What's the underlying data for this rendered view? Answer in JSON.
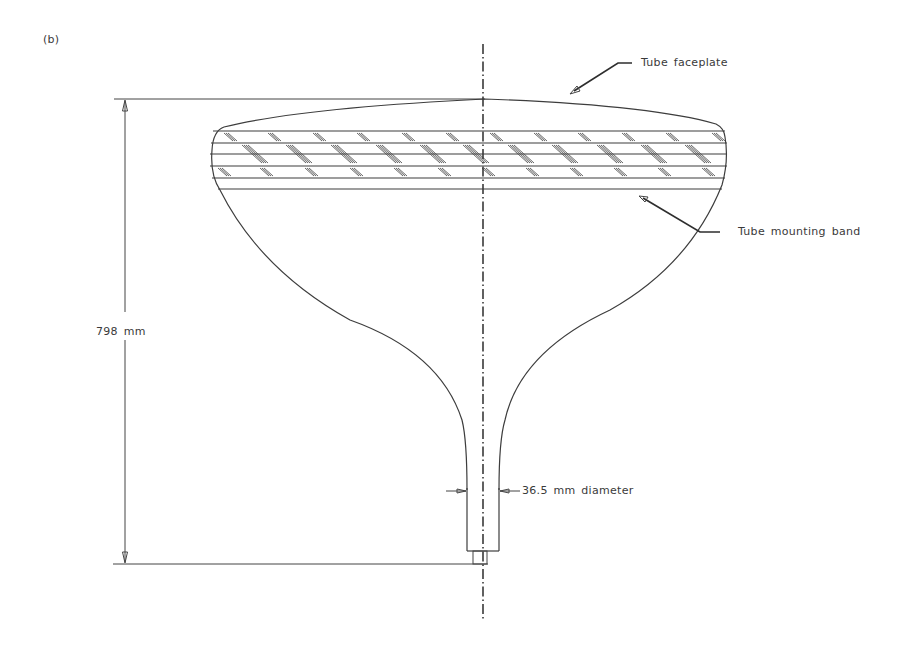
{
  "figure": {
    "panel_label": "(b)",
    "labels": {
      "faceplate": "Tube faceplate",
      "mounting_band": "Tube mounting band",
      "height_dimension": "798 mm",
      "neck_diameter": "36.5 mm diameter"
    },
    "dimensions": {
      "overall_height_mm": 798,
      "neck_diameter_mm": 36.5
    },
    "colors": {
      "line": "#3d3d3d",
      "background": "#ffffff"
    }
  }
}
